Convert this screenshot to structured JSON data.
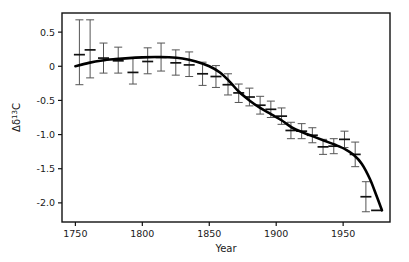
{
  "chart_data": {
    "type": "scatter",
    "title": "",
    "subtitle": "",
    "xlabel": "Year",
    "ylabel": "Δδ¹³C",
    "ylabel_parts": {
      "prefix": "Δδ",
      "superscript": "13",
      "suffix": "C"
    },
    "xlim": [
      1740,
      1985
    ],
    "ylim": [
      -2.28,
      0.78
    ],
    "grid": false,
    "legend": null,
    "xticks": [
      1750,
      1800,
      1850,
      1900,
      1950
    ],
    "xticklabels": [
      "1750",
      "1800",
      "1850",
      "1900",
      "1950"
    ],
    "yticks": [
      0.5,
      0,
      -0.5,
      -1.0,
      -1.5,
      -2.0
    ],
    "yticklabels": [
      "0.5",
      "0",
      "-0.5",
      "-1.0",
      "-1.5",
      "-2.0"
    ],
    "error_bar_style": "vertical-with-caps-and-horizontal-marker",
    "x": [
      1753,
      1761,
      1771,
      1782,
      1793,
      1804,
      1814,
      1825,
      1835,
      1845,
      1855,
      1864,
      1872,
      1880,
      1888,
      1896,
      1904,
      1911,
      1919,
      1927,
      1935,
      1943,
      1951,
      1959,
      1967,
      1975
    ],
    "y": [
      0.17,
      0.24,
      0.12,
      0.08,
      -0.09,
      0.07,
      0.13,
      0.05,
      0.02,
      -0.11,
      -0.15,
      -0.27,
      -0.39,
      -0.45,
      -0.57,
      -0.63,
      -0.73,
      -0.94,
      -0.95,
      -1.01,
      -1.18,
      -1.17,
      -1.07,
      -1.29,
      -1.91,
      -2.11
    ],
    "yerr_upper": [
      0.51,
      0.44,
      0.22,
      0.2,
      0.21,
      0.2,
      0.21,
      0.19,
      0.19,
      0.17,
      0.16,
      0.16,
      0.13,
      0.13,
      0.13,
      0.12,
      0.12,
      0.12,
      0.11,
      0.11,
      0.11,
      0.11,
      0.12,
      0.18,
      0.22,
      0.0
    ],
    "yerr_lower": [
      0.44,
      0.41,
      0.22,
      0.18,
      0.17,
      0.18,
      0.2,
      0.18,
      0.17,
      0.17,
      0.16,
      0.15,
      0.14,
      0.13,
      0.13,
      0.12,
      0.12,
      0.12,
      0.11,
      0.11,
      0.11,
      0.11,
      0.12,
      0.18,
      0.22,
      0.0
    ],
    "fit_curve_label": "smooth trend line",
    "fit_curve_points": [
      [
        1750,
        0.0
      ],
      [
        1760,
        0.05
      ],
      [
        1770,
        0.085
      ],
      [
        1780,
        0.105
      ],
      [
        1790,
        0.12
      ],
      [
        1800,
        0.13
      ],
      [
        1810,
        0.135
      ],
      [
        1820,
        0.133
      ],
      [
        1830,
        0.115
      ],
      [
        1840,
        0.07
      ],
      [
        1850,
        0.0
      ],
      [
        1858,
        -0.09
      ],
      [
        1865,
        -0.22
      ],
      [
        1872,
        -0.37
      ],
      [
        1880,
        -0.5
      ],
      [
        1888,
        -0.61
      ],
      [
        1896,
        -0.7
      ],
      [
        1904,
        -0.79
      ],
      [
        1912,
        -0.9
      ],
      [
        1920,
        -0.97
      ],
      [
        1928,
        -1.03
      ],
      [
        1936,
        -1.09
      ],
      [
        1944,
        -1.15
      ],
      [
        1952,
        -1.22
      ],
      [
        1958,
        -1.3
      ],
      [
        1964,
        -1.43
      ],
      [
        1970,
        -1.65
      ],
      [
        1975,
        -1.9
      ],
      [
        1979,
        -2.11
      ]
    ]
  },
  "axes": {
    "frame_color": "#111111",
    "tick_color": "#111111",
    "marker_color": "#111111",
    "errorbar_color": "#555555",
    "curve_color": "#000000",
    "background": "#ffffff"
  }
}
